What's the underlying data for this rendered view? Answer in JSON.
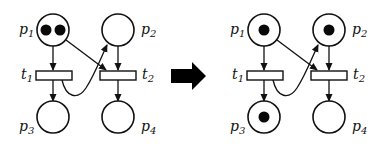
{
  "diagram": {
    "colors": {
      "stroke": "#111111",
      "token": "#0a0a0a",
      "background": "#ffffff",
      "arrow": "#000000"
    },
    "before": {
      "places": [
        {
          "id": "p1",
          "label": "p",
          "sub": "1",
          "tokens": 2
        },
        {
          "id": "p2",
          "label": "p",
          "sub": "2",
          "tokens": 0
        },
        {
          "id": "p3",
          "label": "p",
          "sub": "3",
          "tokens": 0
        },
        {
          "id": "p4",
          "label": "p",
          "sub": "4",
          "tokens": 0
        }
      ],
      "transitions": [
        {
          "id": "t1",
          "label": "t",
          "sub": "1"
        },
        {
          "id": "t2",
          "label": "t",
          "sub": "2"
        }
      ]
    },
    "after": {
      "places": [
        {
          "id": "p1",
          "label": "p",
          "sub": "1",
          "tokens": 1
        },
        {
          "id": "p2",
          "label": "p",
          "sub": "2",
          "tokens": 1
        },
        {
          "id": "p3",
          "label": "p",
          "sub": "3",
          "tokens": 1
        },
        {
          "id": "p4",
          "label": "p",
          "sub": "4",
          "tokens": 0
        }
      ],
      "transitions": [
        {
          "id": "t1",
          "label": "t",
          "sub": "1"
        },
        {
          "id": "t2",
          "label": "t",
          "sub": "2"
        }
      ]
    },
    "arcs": [
      "p1->t1",
      "p1->t2",
      "p2->t2",
      "t1->p3",
      "t1->p2",
      "t2->p4"
    ],
    "transition_arrow": "right-arrow"
  }
}
